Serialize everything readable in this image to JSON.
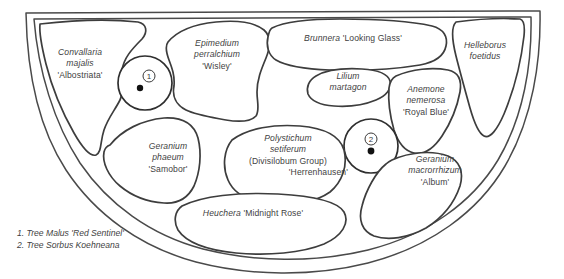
{
  "diagram": {
    "type": "garden-planting-plan",
    "outline_shape": "half-round bed, straight along the top, curved along the bottom",
    "stroke_color": "#3d3d3d",
    "background_color": "#ffffff"
  },
  "plant_beds": [
    {
      "id": "convallaria",
      "name": "Convallaria majalis 'Albostriata'",
      "lines": [
        {
          "text": "Convallaria",
          "style": "italic"
        },
        {
          "text": "majalis",
          "style": "italic"
        },
        {
          "text": "'Albostriata'",
          "style": "upright"
        }
      ]
    },
    {
      "id": "epimedium",
      "name": "Epimedium perralchium 'Wisley'",
      "lines": [
        {
          "text": "Epimedium",
          "style": "italic"
        },
        {
          "text": "perralchium",
          "style": "italic"
        },
        {
          "text": "'Wisley'",
          "style": "upright"
        }
      ]
    },
    {
      "id": "brunnera",
      "name": "Brunnera 'Looking Glass'",
      "lines": [
        {
          "text": "Brunnera ",
          "style": "italic",
          "suffix": "'Looking Glass'",
          "suffix_style": "upright"
        }
      ]
    },
    {
      "id": "helleborus",
      "name": "Helleborus foetidus",
      "lines": [
        {
          "text": "Helleborus",
          "style": "italic"
        },
        {
          "text": "foetidus",
          "style": "italic"
        }
      ]
    },
    {
      "id": "lilium",
      "name": "Lilium martagon",
      "lines": [
        {
          "text": "Lilium",
          "style": "italic"
        },
        {
          "text": "martagon",
          "style": "italic"
        }
      ]
    },
    {
      "id": "anemone",
      "name": "Anemone nemerosa 'Royal Blue'",
      "lines": [
        {
          "text": "Anemone",
          "style": "italic"
        },
        {
          "text": "nemerosa",
          "style": "italic"
        },
        {
          "text": "'Royal Blue'",
          "style": "upright"
        }
      ]
    },
    {
      "id": "geranium-phaeum",
      "name": "Geranium phaeum 'Samobor'",
      "lines": [
        {
          "text": "Geranium",
          "style": "italic"
        },
        {
          "text": "phaeum",
          "style": "italic"
        },
        {
          "text": "'Samobor'",
          "style": "upright"
        }
      ]
    },
    {
      "id": "polystichum",
      "name": "Polystichum setiferum (Divisilobum Group) 'Herrenhausen'",
      "lines": [
        {
          "text": "Polystichum",
          "style": "italic"
        },
        {
          "text": "setiferum",
          "style": "italic"
        },
        {
          "text": "(Divisilobum Group)",
          "style": "upright"
        },
        {
          "text": "'Herrenhausen'",
          "style": "upright"
        }
      ]
    },
    {
      "id": "geranium-macrorrhizum",
      "name": "Geranium macrorrhizum 'Album'",
      "lines": [
        {
          "text": "Geranium",
          "style": "italic"
        },
        {
          "text": "macrorrhizum",
          "style": "italic"
        },
        {
          "text": "'Album'",
          "style": "upright"
        }
      ]
    },
    {
      "id": "heuchera",
      "name": "Heuchera 'Midnight Rose'",
      "lines": [
        {
          "text": "Heuchera ",
          "style": "italic",
          "suffix": "'Midnight Rose'",
          "suffix_style": "upright"
        }
      ]
    }
  ],
  "tree_markers": [
    {
      "number": "1",
      "glyph": "①",
      "label_in_plan": "1"
    },
    {
      "number": "2",
      "glyph": "②",
      "label_in_plan": "2"
    }
  ],
  "legend": {
    "entries": [
      "1. Tree Malus 'Red Sentinel'",
      "2. Tree Sorbus Koehneana"
    ]
  },
  "labels": {
    "convallaria_l1": "Convallaria",
    "convallaria_l2": "majalis",
    "convallaria_l3": "'Albostriata'",
    "epimedium_l1": "Epimedium",
    "epimedium_l2": "perralchium",
    "epimedium_l3": "'Wisley'",
    "brunnera_genus": "Brunnera",
    "brunnera_cultivar": "'Looking Glass'",
    "helleborus_l1": "Helleborus",
    "helleborus_l2": "foetidus",
    "lilium_l1": "Lilium",
    "lilium_l2": "martagon",
    "anemone_l1": "Anemone",
    "anemone_l2": "nemerosa",
    "anemone_l3": "'Royal Blue'",
    "geranium_phaeum_l1": "Geranium",
    "geranium_phaeum_l2": "phaeum",
    "geranium_phaeum_l3": "'Samobor'",
    "polystichum_l1": "Polystichum",
    "polystichum_l2": "setiferum",
    "polystichum_l3": "(Divisilobum Group)",
    "polystichum_l4": "'Herrenhausen'",
    "geranium_macro_l1": "Geranium",
    "geranium_macro_l2": "macrorrhizum",
    "geranium_macro_l3": "'Album'",
    "heuchera_genus": "Heuchera",
    "heuchera_cultivar": "'Midnight Rose'",
    "marker_one": "1",
    "marker_two": "2",
    "legend_line_1": "1. Tree Malus 'Red Sentinel'",
    "legend_line_2": "2. Tree Sorbus Koehneana"
  }
}
